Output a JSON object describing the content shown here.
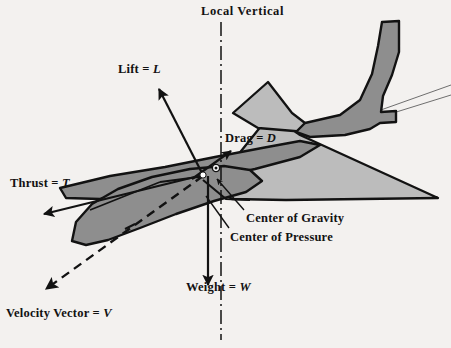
{
  "figure": {
    "background_color": "#f3f1ef",
    "ink_color": "#121212",
    "fuselage_color": "#8e8e8e",
    "wing_color": "#bcbcbc"
  },
  "labels": {
    "local_vertical": "Local  Vertical",
    "lift_text": "Lift = ",
    "lift_symbol": "L",
    "drag_text": "Drag = ",
    "drag_symbol": "D",
    "thrust_text": "Thrust = ",
    "thrust_symbol": "T",
    "weight_text": "Weight = ",
    "weight_symbol": "W",
    "velocity_text": "Velocity  Vector = ",
    "velocity_symbol": "V",
    "center_of_gravity": "Center of Gravity",
    "center_of_pressure": "Center of Pressure"
  },
  "markers": {
    "center_of_pressure_point": "white-dot",
    "center_of_gravity_point": "circle-dot"
  },
  "vectors": [
    {
      "name": "lift",
      "label": "Lift = L",
      "style": "solid-arrow",
      "from": [
        203,
        175
      ],
      "to": [
        158,
        88
      ]
    },
    {
      "name": "drag",
      "label": "Drag = D",
      "style": "solid-arrow",
      "from": [
        192,
        178
      ],
      "to": [
        232,
        150
      ]
    },
    {
      "name": "thrust",
      "label": "Thrust = T",
      "style": "solid-arrow",
      "from": [
        203,
        175
      ],
      "to": [
        42,
        215
      ]
    },
    {
      "name": "weight",
      "label": "Weight = W",
      "style": "solid-arrow",
      "from": [
        208,
        175
      ],
      "to": [
        208,
        286
      ]
    },
    {
      "name": "velocity",
      "label": "Velocity Vector = V",
      "style": "dashed-arrow",
      "from": [
        203,
        175
      ],
      "to": [
        43,
        290
      ]
    },
    {
      "name": "local-vertical",
      "label": "Local Vertical",
      "style": "dash-dot-line",
      "from": [
        221,
        22
      ],
      "to": [
        221,
        340
      ]
    }
  ],
  "leader_lines": [
    {
      "name": "cog-leader",
      "from": [
        243,
        210
      ],
      "to": [
        216,
        180
      ]
    },
    {
      "name": "cop-leader",
      "from": [
        228,
        228
      ],
      "to": [
        205,
        196
      ]
    }
  ]
}
